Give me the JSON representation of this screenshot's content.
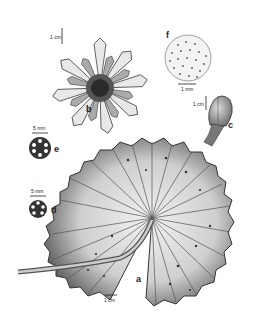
{
  "figure": {
    "panels": [
      {
        "id": "a",
        "label": "a",
        "part": "leaf (lamina with petiole)",
        "scale": "1 cm"
      },
      {
        "id": "b",
        "label": "b",
        "part": "flower",
        "scale": "1 cm"
      },
      {
        "id": "c",
        "label": "c",
        "part": "flower bud",
        "scale": "1 cm"
      },
      {
        "id": "d",
        "label": "d",
        "part": "petiole cross-section",
        "scale": "5 mm"
      },
      {
        "id": "e",
        "label": "e",
        "part": "peduncle cross-section",
        "scale": "5 mm"
      },
      {
        "id": "f",
        "label": "f",
        "part": "seed surface",
        "scale": "1 mm"
      }
    ],
    "colors": {
      "ink": "#222222",
      "leaf_mid": "#9a9a9a",
      "leaf_light": "#e6e6e6",
      "background": "#ffffff"
    }
  }
}
